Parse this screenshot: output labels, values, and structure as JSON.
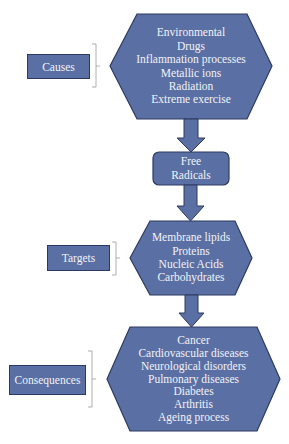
{
  "colors": {
    "fill": "#5a6fa3",
    "stroke": "#2c3a60",
    "text": "#f2f3f8",
    "bracket": "#9a9a9a"
  },
  "causes": {
    "label": "Causes",
    "items": [
      "Environmental",
      "Drugs",
      "Inflammation processes",
      "Metallic ions",
      "Radiation",
      "Extreme exercise"
    ]
  },
  "free_radicals": {
    "lines": [
      "Free",
      "Radicals"
    ]
  },
  "targets": {
    "label": "Targets",
    "items": [
      "Membrane lipids",
      "Proteins",
      "Nucleic Acids",
      "Carbohydrates"
    ]
  },
  "consequences": {
    "label": "Consequences",
    "items": [
      "Cancer",
      "Cardiovascular diseases",
      "Neurological disorders",
      "Pulmonary diseases",
      "Diabetes",
      "Arthritis",
      "Ageing process"
    ]
  }
}
